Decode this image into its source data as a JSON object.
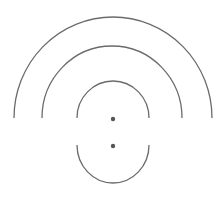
{
  "diagram": {
    "stroke_color": "#6b6b6b",
    "dot_color": "#555555",
    "background": "#ffffff",
    "arcs": [
      {
        "name": "outer-arc",
        "d": "M 14 118 A 99 101 0 0 1 212 118"
      },
      {
        "name": "middle-arc",
        "d": "M 42 118 A 70 72 0 0 1 182 118"
      },
      {
        "name": "inner-top-arc",
        "d": "M 77 118 A 36 37 0 0 1 149 118"
      },
      {
        "name": "inner-bottom-arc",
        "d": "M 77 145 A 36 38 0 0 0 149 145"
      }
    ],
    "dots": [
      {
        "name": "upper-dot",
        "cx": 113,
        "cy": 119,
        "r": 2.2
      },
      {
        "name": "lower-dot",
        "cx": 113,
        "cy": 146,
        "r": 2.2
      }
    ]
  }
}
